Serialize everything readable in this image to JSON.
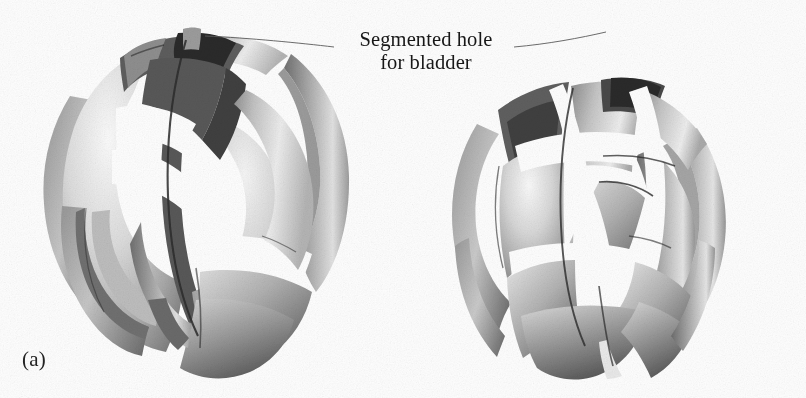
{
  "figure": {
    "kind": "technical-illustration",
    "background_color": "#fefefe",
    "width": 806,
    "height": 398
  },
  "annotation": {
    "line1": "Segmented hole",
    "line2": "for bladder",
    "color": "#171717",
    "leader_lines": [
      {
        "from": [
          205,
          36
        ],
        "to": [
          336,
          46
        ]
      },
      {
        "from": [
          516,
          46
        ],
        "to": [
          604,
          33
        ]
      }
    ]
  },
  "subfigures": [
    {
      "id": "a",
      "label": "(a)",
      "label_pos": [
        22,
        347
      ],
      "center": [
        200,
        195
      ],
      "radius_x": 160,
      "radius_y": 168,
      "description": "sphere of overlapping curved petals, closed configuration with segmented hole at top"
    },
    {
      "id": "b",
      "label": "(b)",
      "label_pos": [
        477,
        347
      ],
      "center": [
        600,
        195
      ],
      "radius_x": 152,
      "radius_y": 165,
      "description": "sphere of interlaced curved petals, rotated/open configuration showing wider gaps"
    }
  ],
  "palette": {
    "paper": "#fefefe",
    "shell_light": "#f2f2f2",
    "shell_mid": "#b9b9b9",
    "shell_dark": "#7d7d7d",
    "shell_shadow": "#575757",
    "cavity_dark": "#3c3c3c",
    "cavity_black": "#222222",
    "edge_line": "#2a2a2a",
    "leader_line": "#5a5a5a",
    "text": "#171717"
  }
}
